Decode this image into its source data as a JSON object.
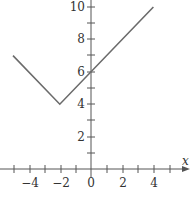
{
  "chart_data": {
    "type": "line",
    "title": "",
    "xlabel": "x",
    "ylabel": "",
    "xlim": [
      -5.6,
      5.9
    ],
    "ylim": [
      0,
      10.4
    ],
    "grid": false,
    "legend": null,
    "x_ticks": [
      -5,
      -4,
      -3,
      -2,
      -1,
      0,
      1,
      2,
      3,
      4,
      5
    ],
    "x_tick_labels": [
      "-4",
      "-2",
      "0",
      "2",
      "4"
    ],
    "x_tick_label_values": [
      -4,
      -2,
      0,
      2,
      4
    ],
    "y_ticks": [
      1,
      2,
      3,
      4,
      5,
      6,
      7,
      8,
      9,
      10
    ],
    "y_tick_labels": [
      "2",
      "4",
      "6",
      "8",
      "10"
    ],
    "y_tick_label_values": [
      2,
      4,
      6,
      8,
      10
    ],
    "series": [
      {
        "name": "f(x)",
        "x": [
          -5,
          -2,
          4
        ],
        "y": [
          7,
          4,
          10
        ],
        "color": "#6b6b6b"
      }
    ]
  },
  "labels": {
    "x_axis": "x",
    "xt_m4": "−4",
    "xt_m2": "−2",
    "xt_0": "0",
    "xt_2": "2",
    "xt_4": "4",
    "yt_2": "2",
    "yt_4": "4",
    "yt_6": "6",
    "yt_8": "8",
    "yt_10": "10"
  }
}
